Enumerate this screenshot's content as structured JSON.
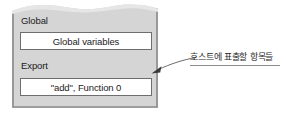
{
  "figure": {
    "type": "memory-layout-diagram",
    "panel": {
      "name": "wasm-instance-memory-panel",
      "fill_color": "#d5d5d5",
      "border_color": "#8a8a8a",
      "torn_top_edge": true,
      "sections": [
        {
          "id": "global",
          "heading": "Global",
          "slot_text": "Global variables"
        },
        {
          "id": "export",
          "heading": "Export",
          "slot_text": "\"add\", Function 0"
        }
      ]
    },
    "annotation": {
      "text": "호스트에 표출할 항목들",
      "has_underline": true,
      "arrow": {
        "name": "callout-arrow",
        "color": "#4a4a4a",
        "points_to": "export-section",
        "tip": [
          152,
          72
        ],
        "tail": [
          196,
          58
        ]
      }
    }
  },
  "icons": {
    "arrowhead": "arrow-head-icon",
    "torn_edge": "torn-paper-edge-icon"
  },
  "colors": {
    "panel_fill": "#d5d5d5",
    "panel_border": "#8a8a8a",
    "slot_fill": "#ffffff",
    "slot_border": "#6e6e6e",
    "text": "#1b1b1b",
    "annotation_text": "#2a2a2a",
    "arrow": "#4a4a4a",
    "background": "#ffffff"
  }
}
